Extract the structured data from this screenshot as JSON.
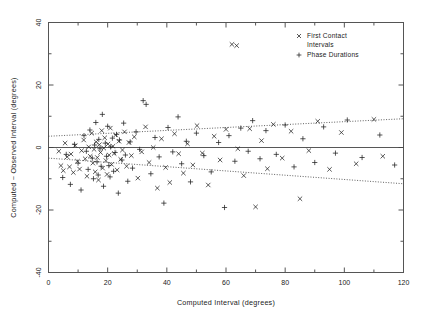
{
  "figure": {
    "background": "#ffffff",
    "frame_color": "#555555",
    "marker_color": "#222222"
  },
  "chart_data": {
    "type": "scatter",
    "title": "",
    "xlabel": "Computed Interval (degrees)",
    "ylabel": "Computed − Observed Interval (degrees)",
    "xlim": [
      0,
      120
    ],
    "ylim": [
      -40,
      40
    ],
    "xticks": [
      0,
      20,
      40,
      60,
      80,
      100,
      120
    ],
    "xticklabels": [
      "0",
      "20",
      "40",
      "60",
      "80",
      "100",
      "120"
    ],
    "yticks": [
      -40,
      -20,
      0,
      20,
      40
    ],
    "yticklabels": [
      "-40",
      "-20",
      "0",
      "20",
      "40"
    ],
    "xminor_step": 10,
    "yminor_step": 10,
    "grid": false,
    "legend_position": "top-right",
    "reference_lines": [
      {
        "name": "zero-line",
        "type": "horizontal",
        "y": 0,
        "style": "solid"
      },
      {
        "name": "upper-envelope",
        "type": "linear",
        "style": "dotted",
        "x0": 0,
        "y0": 3.6,
        "x1": 120,
        "y1": 9.2
      },
      {
        "name": "lower-envelope",
        "type": "linear",
        "style": "dotted",
        "x0": 0,
        "y0": -3.4,
        "x1": 120,
        "y1": -11.6
      }
    ],
    "series": [
      {
        "name": "First Contact Intervals",
        "marker": "x",
        "points": [
          [
            3.5,
            -1.2
          ],
          [
            4.2,
            -5.8
          ],
          [
            5.0,
            -7.4
          ],
          [
            5.6,
            1.4
          ],
          [
            6.3,
            -3.0
          ],
          [
            7.1,
            -6.2
          ],
          [
            7.6,
            -2.1
          ],
          [
            8.4,
            -8.0
          ],
          [
            9.0,
            0.6
          ],
          [
            9.8,
            -4.4
          ],
          [
            10.5,
            -6.9
          ],
          [
            11.2,
            -1.0
          ],
          [
            11.9,
            2.4
          ],
          [
            12.4,
            -3.6
          ],
          [
            13.0,
            -9.2
          ],
          [
            13.6,
            0.2
          ],
          [
            14.1,
            -2.8
          ],
          [
            14.6,
            4.6
          ],
          [
            15.0,
            -5.0
          ],
          [
            15.4,
            -0.6
          ],
          [
            15.8,
            -7.8
          ],
          [
            16.1,
            1.8
          ],
          [
            16.5,
            -3.2
          ],
          [
            16.9,
            -10.4
          ],
          [
            17.2,
            0.9
          ],
          [
            17.6,
            -1.6
          ],
          [
            18.0,
            5.4
          ],
          [
            18.3,
            -6.6
          ],
          [
            18.7,
            -0.2
          ],
          [
            19.0,
            3.1
          ],
          [
            19.4,
            -4.2
          ],
          [
            19.8,
            -8.6
          ],
          [
            20.1,
            1.1
          ],
          [
            20.5,
            -2.4
          ],
          [
            20.9,
            6.2
          ],
          [
            21.3,
            -5.4
          ],
          [
            21.8,
            0.4
          ],
          [
            22.2,
            -1.9
          ],
          [
            22.7,
            4.0
          ],
          [
            23.2,
            -7.2
          ],
          [
            23.8,
            2.0
          ],
          [
            24.4,
            -3.8
          ],
          [
            25.0,
            -0.8
          ],
          [
            25.7,
            5.0
          ],
          [
            26.4,
            -6.0
          ],
          [
            27.2,
            1.6
          ],
          [
            28.0,
            -2.6
          ],
          [
            29.0,
            3.4
          ],
          [
            30.2,
            -9.8
          ],
          [
            31.5,
            -1.4
          ],
          [
            32.8,
            6.6
          ],
          [
            34.0,
            -4.8
          ],
          [
            35.4,
            0.0
          ],
          [
            36.8,
            -13.0
          ],
          [
            38.2,
            2.8
          ],
          [
            39.6,
            -6.4
          ],
          [
            41.0,
            -11.2
          ],
          [
            42.6,
            4.4
          ],
          [
            44.0,
            -2.0
          ],
          [
            45.6,
            -8.2
          ],
          [
            47.0,
            1.2
          ],
          [
            48.8,
            -5.6
          ],
          [
            50.2,
            7.0
          ],
          [
            52.0,
            -1.8
          ],
          [
            54.0,
            -12.0
          ],
          [
            56.0,
            3.6
          ],
          [
            58.0,
            -4.0
          ],
          [
            60.0,
            5.8
          ],
          [
            62.0,
            33.0
          ],
          [
            63.6,
            32.6
          ],
          [
            64.0,
            -0.4
          ],
          [
            66.0,
            -9.0
          ],
          [
            68.0,
            6.0
          ],
          [
            70.0,
            -19.0
          ],
          [
            72.0,
            2.2
          ],
          [
            74.0,
            -6.8
          ],
          [
            76.0,
            7.4
          ],
          [
            79.0,
            -3.4
          ],
          [
            82.0,
            5.2
          ],
          [
            85.0,
            -16.4
          ],
          [
            88.0,
            -1.0
          ],
          [
            91.0,
            8.4
          ],
          [
            95.0,
            -7.0
          ],
          [
            99.0,
            4.8
          ],
          [
            104.0,
            -5.2
          ],
          [
            110.0,
            9.0
          ],
          [
            113.0,
            -2.8
          ]
        ]
      },
      {
        "name": "Phase Durations",
        "marker": "+",
        "points": [
          [
            4.8,
            -9.6
          ],
          [
            6.0,
            -2.2
          ],
          [
            7.4,
            -11.8
          ],
          [
            8.8,
            1.0
          ],
          [
            10.0,
            -5.0
          ],
          [
            11.0,
            -13.6
          ],
          [
            12.0,
            3.8
          ],
          [
            12.8,
            -1.2
          ],
          [
            13.4,
            -7.0
          ],
          [
            14.0,
            5.6
          ],
          [
            14.8,
            -3.4
          ],
          [
            15.2,
            -10.0
          ],
          [
            15.6,
            0.8
          ],
          [
            16.0,
            8.0
          ],
          [
            16.4,
            -4.6
          ],
          [
            16.8,
            -8.8
          ],
          [
            17.0,
            2.6
          ],
          [
            17.4,
            -0.4
          ],
          [
            17.8,
            -6.0
          ],
          [
            18.2,
            10.6
          ],
          [
            18.6,
            -12.4
          ],
          [
            19.2,
            1.4
          ],
          [
            19.6,
            -2.8
          ],
          [
            20.0,
            6.8
          ],
          [
            20.4,
            -5.8
          ],
          [
            20.8,
            -9.4
          ],
          [
            21.0,
            0.2
          ],
          [
            21.6,
            3.0
          ],
          [
            22.0,
            -7.6
          ],
          [
            22.5,
            -1.6
          ],
          [
            23.0,
            4.2
          ],
          [
            23.6,
            -14.6
          ],
          [
            24.0,
            2.4
          ],
          [
            24.8,
            -4.0
          ],
          [
            25.4,
            7.8
          ],
          [
            26.0,
            -2.4
          ],
          [
            26.8,
            -10.8
          ],
          [
            27.6,
            1.8
          ],
          [
            28.4,
            -6.6
          ],
          [
            29.6,
            5.0
          ],
          [
            30.8,
            -0.6
          ],
          [
            32.0,
            15.0
          ],
          [
            33.0,
            13.8
          ],
          [
            34.6,
            -8.4
          ],
          [
            36.0,
            3.2
          ],
          [
            37.4,
            -3.0
          ],
          [
            39.0,
            -17.8
          ],
          [
            40.4,
            6.4
          ],
          [
            42.0,
            -1.4
          ],
          [
            43.8,
            9.8
          ],
          [
            45.0,
            -5.2
          ],
          [
            46.6,
            2.0
          ],
          [
            48.0,
            -11.0
          ],
          [
            50.0,
            4.6
          ],
          [
            52.5,
            -2.6
          ],
          [
            55.0,
            -7.8
          ],
          [
            57.5,
            1.6
          ],
          [
            59.5,
            -19.2
          ],
          [
            61.0,
            3.8
          ],
          [
            63.0,
            -4.4
          ],
          [
            65.0,
            6.2
          ],
          [
            67.5,
            -1.2
          ],
          [
            69.0,
            8.6
          ],
          [
            71.5,
            -3.6
          ],
          [
            73.5,
            5.4
          ],
          [
            77.0,
            -2.2
          ],
          [
            80.0,
            7.2
          ],
          [
            83.0,
            -6.2
          ],
          [
            86.0,
            2.8
          ],
          [
            90.0,
            -4.8
          ],
          [
            93.0,
            6.6
          ],
          [
            97.0,
            -1.8
          ],
          [
            101.0,
            8.8
          ],
          [
            106.0,
            -3.2
          ],
          [
            112.0,
            4.0
          ],
          [
            117.0,
            -5.6
          ]
        ]
      }
    ]
  },
  "legend": {
    "items": [
      {
        "label_line1": "First Contact",
        "label_line2": "Intervals",
        "marker": "x"
      },
      {
        "label_line1": "Phase Durations",
        "label_line2": "",
        "marker": "+"
      }
    ]
  }
}
